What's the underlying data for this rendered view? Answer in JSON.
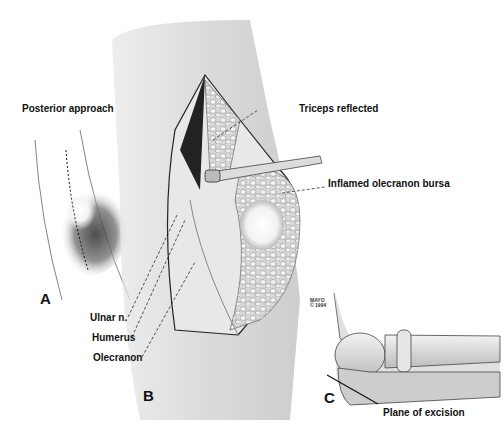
{
  "figure": {
    "panels": [
      {
        "id": "A",
        "label": "A",
        "title": "Posterior approach"
      },
      {
        "id": "B",
        "label": "B"
      },
      {
        "id": "C",
        "label": "C"
      }
    ],
    "labels": {
      "posterior_approach": "Posterior approach",
      "triceps_reflected": "Triceps reflected",
      "inflamed_bursa": "Inflamed olecranon  bursa",
      "ulnar_n": "Ulnar n.",
      "humerus": "Humerus",
      "olecranon": "Olecranon",
      "plane_of_excision": "Plane of excision"
    },
    "copyright": {
      "line1": "MAYO",
      "line2": "© 1994"
    },
    "colors": {
      "background": "#ffffff",
      "ink": "#111111",
      "shade": "#8a8a8a"
    }
  }
}
